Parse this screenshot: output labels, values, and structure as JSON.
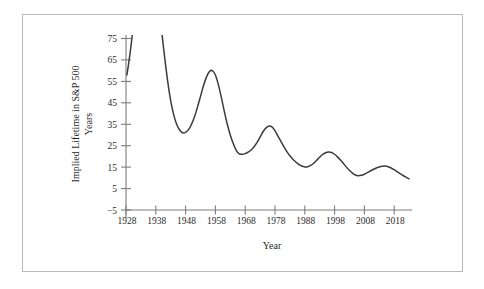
{
  "figure": {
    "frame_color": "#b9b9b9",
    "background": "#ffffff",
    "axis_color": "#7d7d7d",
    "curve_color": "#3b3b3b"
  },
  "chart_data": {
    "type": "line",
    "title": "",
    "xlabel": "Year",
    "ylabel": "Implied Lifetime in S&P 500",
    "ylabel_line2": "Years",
    "xlim": [
      1928,
      2024
    ],
    "ylim": [
      -5,
      78
    ],
    "xticks": [
      1928,
      1938,
      1948,
      1958,
      1968,
      1978,
      1988,
      1998,
      2008,
      2018
    ],
    "xtick_labels": [
      "1928",
      "1938",
      "1948",
      "1958",
      "1968",
      "1978",
      "1988",
      "1998",
      "2008",
      "2018"
    ],
    "yticks": [
      -5,
      5,
      15,
      25,
      35,
      45,
      55,
      65,
      75
    ],
    "ytick_labels": [
      "−5",
      "5",
      "15",
      "25",
      "35",
      "45",
      "55",
      "65",
      "75"
    ],
    "grid": false,
    "legend": "none",
    "series": [
      {
        "name": "Implied Lifetime (early segment)",
        "clipped_above": true,
        "x": [
          1928.3,
          1928.8,
          1929.3,
          1929.8,
          1930.2
        ],
        "y": [
          58.0,
          62.5,
          67.5,
          73.0,
          78.0
        ]
      },
      {
        "name": "Implied Lifetime (main segment)",
        "clipped_above": true,
        "x": [
          1940.0,
          1941.0,
          1942.0,
          1943.0,
          1944.0,
          1945.0,
          1946.0,
          1947.0,
          1948.0,
          1949.0,
          1950.0,
          1951.0,
          1952.0,
          1953.0,
          1954.0,
          1955.0,
          1956.0,
          1957.0,
          1958.0,
          1959.0,
          1960.0,
          1961.0,
          1962.0,
          1963.0,
          1964.0,
          1965.0,
          1966.0,
          1967.0,
          1968.0,
          1969.0,
          1970.0,
          1971.0,
          1972.0,
          1973.0,
          1974.0,
          1975.0,
          1976.0,
          1977.0,
          1978.0,
          1979.0,
          1980.0,
          1981.0,
          1982.0,
          1983.0,
          1984.0,
          1985.0,
          1986.0,
          1987.0,
          1988.0,
          1989.0,
          1990.0,
          1991.0,
          1992.0,
          1993.0,
          1994.0,
          1995.0,
          1996.0,
          1997.0,
          1998.0,
          1999.0,
          2000.0,
          2001.0,
          2002.0,
          2003.0,
          2004.0,
          2005.0,
          2006.0,
          2007.0,
          2008.0,
          2009.0,
          2010.0,
          2011.0,
          2012.0,
          2013.0,
          2014.0,
          2015.0,
          2016.0,
          2017.0,
          2018.0,
          2019.0,
          2020.0,
          2021.0,
          2022.0,
          2023.0
        ],
        "y": [
          78.0,
          66.0,
          55.0,
          46.0,
          39.5,
          35.0,
          32.3,
          31.0,
          31.2,
          32.5,
          35.0,
          38.5,
          43.0,
          48.0,
          53.0,
          57.0,
          59.6,
          60.0,
          58.0,
          53.5,
          47.5,
          41.0,
          35.0,
          30.0,
          26.0,
          22.8,
          21.2,
          21.0,
          21.3,
          22.0,
          23.0,
          24.5,
          26.5,
          29.0,
          31.5,
          33.3,
          34.2,
          33.8,
          32.0,
          29.5,
          27.0,
          24.5,
          22.2,
          20.3,
          18.7,
          17.4,
          16.3,
          15.5,
          15.1,
          15.2,
          15.8,
          16.8,
          18.2,
          19.6,
          20.9,
          21.7,
          22.0,
          21.8,
          21.0,
          19.8,
          18.3,
          16.7,
          15.0,
          13.5,
          12.2,
          11.3,
          11.0,
          11.2,
          11.7,
          12.4,
          13.2,
          13.9,
          14.6,
          15.1,
          15.4,
          15.5,
          15.2,
          14.6,
          13.8,
          12.9,
          12.0,
          11.1,
          10.3,
          9.5
        ]
      }
    ]
  }
}
